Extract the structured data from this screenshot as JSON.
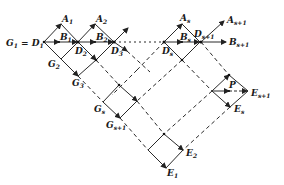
{
  "diagram": {
    "type": "lattice diagram",
    "colors": {
      "line": "#2a2a2a",
      "background": "#ffffff"
    },
    "labels": {
      "G1D1": {
        "base": "G",
        "sub": "1",
        "eq": " = D",
        "sub2": "1"
      },
      "A1": {
        "base": "A",
        "sub": "1"
      },
      "A2": {
        "base": "A",
        "sub": "2"
      },
      "B1": {
        "base": "B",
        "sub": "1"
      },
      "B2": {
        "base": "B",
        "sub": "2"
      },
      "D2": {
        "base": "D",
        "sub": "2"
      },
      "D3": {
        "base": "D",
        "sub": "3"
      },
      "G2": {
        "base": "G",
        "sub": "2"
      },
      "G3": {
        "base": "G",
        "sub": "3"
      },
      "As": {
        "base": "A",
        "sub": "s"
      },
      "Bs": {
        "base": "B",
        "sub": "s"
      },
      "Ds": {
        "base": "D",
        "sub": "s"
      },
      "Ds1": {
        "base": "D",
        "sub": "s+1"
      },
      "As1": {
        "base": "A",
        "sub": "s+1"
      },
      "Bs1": {
        "base": "B",
        "sub": "s+1"
      },
      "Gs": {
        "base": "G",
        "sub": "s"
      },
      "Gs1": {
        "base": "G",
        "sub": "s+1"
      },
      "P": {
        "base": "P",
        "sub": ""
      },
      "Es1": {
        "base": "E",
        "sub": "s+1"
      },
      "Es": {
        "base": "E",
        "sub": "s"
      },
      "E2": {
        "base": "E",
        "sub": "2"
      },
      "E1": {
        "base": "E",
        "sub": "1"
      }
    }
  }
}
